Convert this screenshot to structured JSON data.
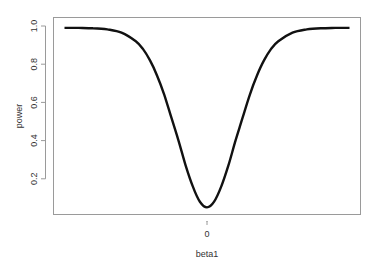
{
  "chart_data": {
    "type": "line",
    "title": "",
    "xlabel": "beta1",
    "ylabel": "power",
    "x_ticks": [
      {
        "value": 0,
        "label": "0"
      }
    ],
    "y_ticks": [
      {
        "value": 0.2,
        "label": "0.2"
      },
      {
        "value": 0.4,
        "label": "0.4"
      },
      {
        "value": 0.6,
        "label": "0.6"
      },
      {
        "value": 0.8,
        "label": "0.8"
      },
      {
        "value": 1.0,
        "label": "1.0"
      }
    ],
    "xlim": [
      -1.04,
      1.08
    ],
    "ylim": [
      0.0,
      1.03
    ],
    "grid": false,
    "legend": null,
    "series": [
      {
        "name": "power",
        "color": "#111111",
        "x": [
          -1.0,
          -0.9,
          -0.8,
          -0.7,
          -0.6,
          -0.5,
          -0.45,
          -0.4,
          -0.35,
          -0.3,
          -0.25,
          -0.2,
          -0.15,
          -0.1,
          -0.05,
          0.0,
          0.05,
          0.1,
          0.15,
          0.2,
          0.25,
          0.3,
          0.35,
          0.4,
          0.45,
          0.5,
          0.6,
          0.7,
          0.8,
          0.9,
          1.0
        ],
        "values": [
          0.99,
          0.99,
          0.988,
          0.982,
          0.965,
          0.92,
          0.88,
          0.82,
          0.74,
          0.64,
          0.52,
          0.4,
          0.27,
          0.16,
          0.08,
          0.05,
          0.08,
          0.16,
          0.27,
          0.4,
          0.52,
          0.64,
          0.74,
          0.82,
          0.88,
          0.92,
          0.965,
          0.982,
          0.988,
          0.99,
          0.99
        ]
      }
    ]
  }
}
